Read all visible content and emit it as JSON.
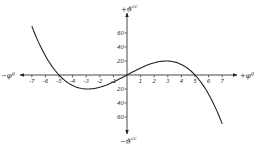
{
  "chart_data": {
    "type": "line",
    "title": "",
    "xlabel_positive": "+φ",
    "xlabel_positive_sup": "g",
    "xlabel_negative": "−φ",
    "xlabel_negative_sup": "g",
    "ylabel_positive": "+ϑ",
    "ylabel_positive_sup": "cc",
    "ylabel_negative": "−ϑ",
    "ylabel_negative_sup": "cc",
    "xlim": [
      -7,
      7
    ],
    "ylim": [
      -70,
      70
    ],
    "x_ticks": [
      -7,
      -6,
      -5,
      -4,
      -3,
      -2,
      -1,
      1,
      2,
      3,
      4,
      5,
      6,
      7
    ],
    "y_ticks": [
      60,
      40,
      20,
      -20,
      -40,
      -60
    ],
    "y_tick_labels": [
      "60",
      "40",
      "20",
      "20",
      "40",
      "60"
    ],
    "grid": false,
    "legend": null,
    "series": [
      {
        "name": "curve",
        "x": [
          -7,
          -6,
          -5,
          -4,
          -3,
          -2.89,
          -2,
          -1,
          0,
          1,
          2,
          2.89,
          3,
          4,
          5,
          6,
          7
        ],
        "y": [
          70,
          28,
          0,
          -15,
          -20,
          -20,
          -17.6,
          -10,
          0,
          10,
          17.6,
          20,
          20,
          15,
          0,
          -28,
          -70
        ]
      }
    ],
    "annotations": [
      "zero crossings at x = -5, 0, 5",
      "local max ≈ 20 near x ≈ 2.9",
      "local min ≈ -20 near x ≈ -2.9"
    ]
  }
}
